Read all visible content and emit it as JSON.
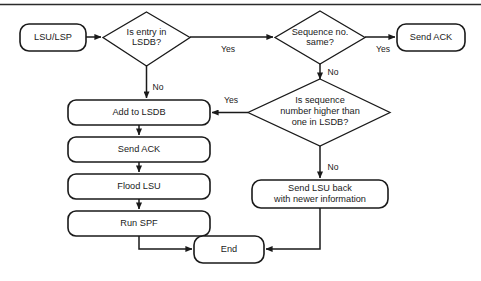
{
  "diagram": {
    "type": "flowchart",
    "colors": {
      "stroke": "#1a1a1a",
      "fill": "#ffffff",
      "text": "#1a1a1a",
      "frame": "#2b2b2b"
    },
    "nodes": [
      {
        "id": "start",
        "shape": "rounded-rect",
        "label": "LSU/LSP"
      },
      {
        "id": "is-entry",
        "shape": "diamond",
        "label_line1": "Is entry in",
        "label_line2": "LSDB?"
      },
      {
        "id": "seq-same",
        "shape": "diamond",
        "label_line1": "Sequence no.",
        "label_line2": "same?"
      },
      {
        "id": "send-ack-top",
        "shape": "rounded-rect",
        "label": "Send ACK"
      },
      {
        "id": "seq-higher",
        "shape": "diamond",
        "label_line1": "Is sequence",
        "label_line2": "number higher than",
        "label_line3": "one in LSDB?"
      },
      {
        "id": "add-lsdb",
        "shape": "rounded-rect",
        "label": "Add to LSDB"
      },
      {
        "id": "send-ack",
        "shape": "rounded-rect",
        "label": "Send ACK"
      },
      {
        "id": "flood-lsu",
        "shape": "rounded-rect",
        "label": "Flood LSU"
      },
      {
        "id": "run-spf",
        "shape": "rounded-rect",
        "label": "Run SPF"
      },
      {
        "id": "send-lsu-back",
        "shape": "rounded-rect",
        "label_line1": "Send LSU back",
        "label_line2": "with newer information"
      },
      {
        "id": "end",
        "shape": "rounded-rect",
        "label": "End"
      }
    ],
    "edge_labels": {
      "entry_yes": "Yes",
      "entry_no": "No",
      "seq_same_yes": "Yes",
      "seq_same_no": "No",
      "seq_higher_yes": "Yes",
      "seq_higher_no": "No"
    }
  }
}
